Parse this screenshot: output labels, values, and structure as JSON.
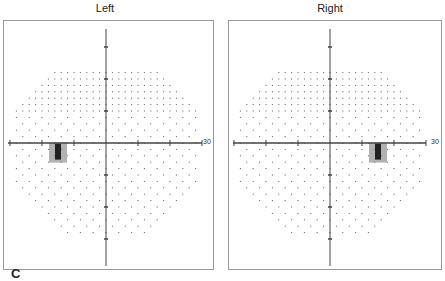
{
  "figure": {
    "panel_label": "C",
    "colors": {
      "axis": "#444444",
      "dot": "#555555",
      "defect_dark": "#222222",
      "defect_mid": "#666666",
      "border": "#999999"
    }
  },
  "chart_data": [
    {
      "type": "scatter",
      "title": "Left",
      "xlabel": "",
      "ylabel": "",
      "xlim": [
        -30,
        30
      ],
      "ylim": [
        -30,
        30
      ],
      "tick_labels": [
        "30"
      ],
      "grid": false,
      "description": "Visual field dot plot (grayscale); octagonal test grid of dots with dense region in the upper field; dark blind-spot scotoma just below horizontal meridian temporal-left (approx x=-15, y=-3).",
      "scotoma": {
        "x": -15,
        "y": -3,
        "label": "blind spot"
      }
    },
    {
      "type": "scatter",
      "title": "Right",
      "xlabel": "",
      "ylabel": "",
      "xlim": [
        -30,
        30
      ],
      "ylim": [
        -30,
        30
      ],
      "tick_labels": [
        "30"
      ],
      "grid": false,
      "description": "Visual field dot plot (grayscale); octagonal test grid; dark blind-spot scotoma just below horizontal meridian right side (approx x=15, y=-3).",
      "scotoma": {
        "x": 15,
        "y": -3,
        "label": "blind spot"
      }
    }
  ]
}
